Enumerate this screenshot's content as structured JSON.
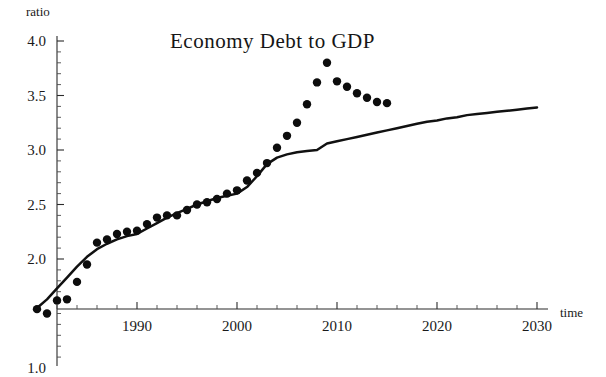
{
  "chart_data": {
    "type": "line",
    "title": "Economy  Debt  to  GDP",
    "xlabel": "time",
    "ylabel": "ratio",
    "xlim": [
      1979,
      2031
    ],
    "ylim": [
      1.0,
      4.05
    ],
    "grid": false,
    "legend": "none",
    "x_ticks_major": [
      1990,
      2000,
      2010,
      2020,
      2030
    ],
    "x_tick_labels": [
      "1990",
      "2000",
      "2010",
      "2020",
      "2030"
    ],
    "x_tick_minor_step": 2,
    "y_ticks_major": [
      1.0,
      2.0,
      2.5,
      3.0,
      3.5,
      4.0
    ],
    "y_tick_labels": [
      "1.0",
      "2.0",
      "2.5",
      "3.0",
      "3.5",
      "4.0"
    ],
    "y_tick_minor_step": 0.1,
    "axis_baseline_value": 1.5,
    "series": [
      {
        "name": "model-trend-curve",
        "style": "solid-line",
        "x": [
          1980,
          1981,
          1982,
          1983,
          1984,
          1985,
          1986,
          1987,
          1988,
          1989,
          1990,
          1991,
          1992,
          1993,
          1994,
          1995,
          1996,
          1997,
          1998,
          1999,
          2000,
          2001,
          2002,
          2003,
          2004,
          2005,
          2006,
          2007,
          2008,
          2009,
          2010,
          2011,
          2012,
          2013,
          2014,
          2015,
          2016,
          2017,
          2018,
          2019,
          2020,
          2021,
          2022,
          2023,
          2024,
          2025,
          2026,
          2027,
          2028,
          2029,
          2030
        ],
        "values": [
          1.55,
          1.63,
          1.73,
          1.83,
          1.93,
          2.02,
          2.09,
          2.14,
          2.18,
          2.21,
          2.23,
          2.28,
          2.33,
          2.38,
          2.42,
          2.46,
          2.5,
          2.53,
          2.56,
          2.58,
          2.6,
          2.66,
          2.76,
          2.87,
          2.93,
          2.96,
          2.98,
          2.99,
          3.0,
          3.06,
          3.08,
          3.1,
          3.12,
          3.14,
          3.16,
          3.18,
          3.2,
          3.22,
          3.24,
          3.26,
          3.27,
          3.29,
          3.3,
          3.32,
          3.33,
          3.34,
          3.35,
          3.36,
          3.37,
          3.38,
          3.39
        ]
      },
      {
        "name": "observed-debt-ratio-points",
        "style": "dotted-points",
        "x": [
          1980,
          1981,
          1982,
          1983,
          1984,
          1985,
          1986,
          1987,
          1988,
          1989,
          1990,
          1991,
          1992,
          1993,
          1994,
          1995,
          1996,
          1997,
          1998,
          1999,
          2000,
          2001,
          2002,
          2003,
          2004,
          2005,
          2006,
          2007,
          2008,
          2009,
          2010,
          2011,
          2012,
          2013,
          2014,
          2015
        ],
        "values": [
          1.54,
          1.5,
          1.62,
          1.63,
          1.79,
          1.95,
          2.15,
          2.18,
          2.23,
          2.25,
          2.26,
          2.32,
          2.38,
          2.4,
          2.4,
          2.45,
          2.5,
          2.52,
          2.55,
          2.6,
          2.63,
          2.72,
          2.79,
          2.88,
          3.02,
          3.13,
          3.25,
          3.42,
          3.62,
          3.8,
          3.63,
          3.58,
          3.52,
          3.48,
          3.44,
          3.43
        ]
      }
    ]
  }
}
